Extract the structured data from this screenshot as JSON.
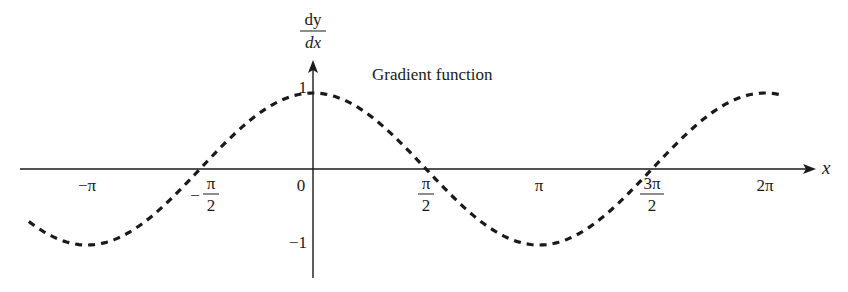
{
  "chart_data": {
    "type": "line",
    "title": "",
    "annotation": "Gradient function",
    "xlabel": "x",
    "ylabel": {
      "numerator": "dy",
      "denominator": "dx"
    },
    "function": "cos(x)",
    "xlim": [
      -4.1,
      6.6
    ],
    "ylim": [
      -1.4,
      1.5
    ],
    "x_ticks": [
      {
        "value": -3.14159,
        "label": "−π",
        "kind": "plain"
      },
      {
        "value": -1.5708,
        "label": "π",
        "prefix": "−",
        "denominator": "2",
        "kind": "fraction"
      },
      {
        "value": 0,
        "label": "0",
        "kind": "plain"
      },
      {
        "value": 1.5708,
        "label": "π",
        "denominator": "2",
        "kind": "fraction"
      },
      {
        "value": 3.14159,
        "label": "π",
        "kind": "plain"
      },
      {
        "value": 4.71239,
        "label": "3π",
        "denominator": "2",
        "kind": "fraction"
      },
      {
        "value": 6.28319,
        "label": "2π",
        "kind": "plain"
      }
    ],
    "y_ticks": [
      {
        "value": 1,
        "label": "1"
      },
      {
        "value": -1,
        "label": "−1"
      }
    ],
    "series": [
      {
        "name": "Gradient function",
        "style": "dashed",
        "color": "#1a1a1a",
        "x_range": [
          -3.95,
          6.52
        ],
        "x": [
          -3.927,
          -3.1416,
          -2.356,
          -1.5708,
          -0.785,
          0,
          0.785,
          1.5708,
          2.356,
          3.1416,
          3.927,
          4.712,
          5.498,
          6.283,
          6.52
        ],
        "y": [
          -0.707,
          -1,
          -0.707,
          0,
          0.707,
          1,
          0.707,
          0,
          -0.707,
          -1,
          -0.707,
          0,
          0.707,
          1,
          0.97
        ]
      }
    ],
    "grid": false,
    "legend": "none"
  }
}
